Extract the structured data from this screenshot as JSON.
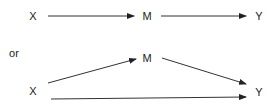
{
  "diagram": {
    "top": {
      "nodes": [
        {
          "id": "X",
          "label": "X",
          "x": 33,
          "y": 16
        },
        {
          "id": "M",
          "label": "M",
          "x": 147,
          "y": 16
        },
        {
          "id": "Y",
          "label": "Y",
          "x": 259,
          "y": 16
        }
      ],
      "edges": [
        {
          "from": "X",
          "to": "M",
          "x1": 48,
          "y1": 16,
          "x2": 134,
          "y2": 16
        },
        {
          "from": "M",
          "to": "Y",
          "x1": 161,
          "y1": 16,
          "x2": 246,
          "y2": 16
        }
      ]
    },
    "separator_text": "or",
    "bottom": {
      "nodes": [
        {
          "id": "M",
          "label": "M",
          "x": 147,
          "y": 58
        },
        {
          "id": "X",
          "label": "X",
          "x": 33,
          "y": 91
        },
        {
          "id": "Y",
          "label": "Y",
          "x": 259,
          "y": 92
        }
      ],
      "edges": [
        {
          "from": "X",
          "to": "M",
          "x1": 48,
          "y1": 83,
          "x2": 136,
          "y2": 59
        },
        {
          "from": "M",
          "to": "Y",
          "x1": 162,
          "y1": 58,
          "x2": 246,
          "y2": 84
        },
        {
          "from": "X",
          "to": "Y",
          "x1": 51,
          "y1": 99,
          "x2": 246,
          "y2": 97
        }
      ]
    },
    "colors": {
      "line": "#333333",
      "text": "#222222"
    }
  }
}
